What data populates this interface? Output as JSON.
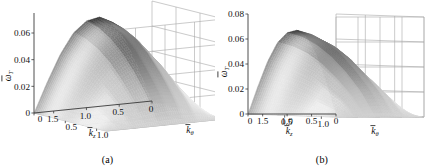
{
  "figure": {
    "panel_count": 2,
    "background_color": "#ffffff",
    "line_color": "#9a9a9a",
    "axis_color": "#4d4d4d",
    "surface_dark": "#1a1a1a",
    "surface_light": "#d8d8d8"
  },
  "chart_data": [
    {
      "type": "surface",
      "panel": "a",
      "caption": "(a)",
      "title": "",
      "view": "oblique-3d",
      "zlabel": "w_T",
      "zlabel_parts": {
        "base": "ω",
        "overbar": true,
        "subscript": "T"
      },
      "zticks": [
        0,
        0.02,
        0.04,
        0.06
      ],
      "ztick_labels": [
        "0",
        "0.02",
        "0.04",
        "0.06"
      ],
      "zlim": [
        0,
        0.07
      ],
      "xlabel": "k_z",
      "xlabel_parts": {
        "base": "k",
        "overbar": true,
        "subscript": "z"
      },
      "xticks": [
        1.5,
        1.0,
        0.5,
        0
      ],
      "xtick_labels": [
        "1.5",
        "1.0",
        "0.5",
        "0"
      ],
      "xlim": [
        1.8,
        0
      ],
      "ylabel": "k_theta",
      "ylabel_parts": {
        "base": "k",
        "overbar": true,
        "subscript": "θ"
      },
      "yticks": [
        0,
        0.5,
        1.0
      ],
      "ytick_labels": [
        "0",
        "0.5",
        "1.0"
      ],
      "ylim": [
        0,
        1.15
      ],
      "grid": true,
      "legend": "none",
      "peak_value": 0.067,
      "peak_at": {
        "k_z": 1.2,
        "k_theta": 0.0
      },
      "surface_z": [
        [
          0.0,
          0.0,
          0.0,
          0.0,
          0.0,
          0.0,
          0.0
        ],
        [
          0.022,
          0.021,
          0.019,
          0.016,
          0.012,
          0.007,
          0.0
        ],
        [
          0.042,
          0.04,
          0.036,
          0.03,
          0.022,
          0.013,
          0.0
        ],
        [
          0.057,
          0.054,
          0.049,
          0.041,
          0.03,
          0.017,
          0.0
        ],
        [
          0.065,
          0.062,
          0.056,
          0.047,
          0.035,
          0.02,
          0.0
        ],
        [
          0.067,
          0.064,
          0.058,
          0.049,
          0.036,
          0.021,
          0.0
        ],
        [
          0.062,
          0.059,
          0.054,
          0.045,
          0.033,
          0.019,
          0.0
        ],
        [
          0.048,
          0.046,
          0.042,
          0.035,
          0.026,
          0.015,
          0.0
        ],
        [
          0.026,
          0.025,
          0.022,
          0.019,
          0.014,
          0.008,
          0.0
        ],
        [
          0.0,
          0.0,
          0.0,
          0.0,
          0.0,
          0.0,
          0.0
        ]
      ]
    },
    {
      "type": "surface",
      "panel": "b",
      "caption": "(b)",
      "title": "",
      "view": "front-3d",
      "zlabel": "w_T",
      "zlabel_parts": {
        "base": "ω",
        "overbar": true,
        "subscript": "T"
      },
      "zticks": [
        0,
        0.02,
        0.04,
        0.06,
        0.08
      ],
      "ztick_labels": [
        "0",
        "0.02",
        "0.04",
        "0.06",
        "0.08"
      ],
      "zlim": [
        0,
        0.08
      ],
      "xlabel": "k_z",
      "xlabel_parts": {
        "base": "k",
        "overbar": true,
        "subscript": "z"
      },
      "xticks": [
        1.5,
        1.0,
        0.5,
        0
      ],
      "xtick_labels": [
        "1.5",
        "1.0",
        "0.5",
        "0"
      ],
      "xlim": [
        1.8,
        0
      ],
      "ylabel": "k_theta",
      "ylabel_parts": {
        "base": "k",
        "overbar": true,
        "subscript": "θ"
      },
      "yticks": [
        0,
        0.5,
        1.0
      ],
      "ytick_labels": [
        "0",
        "0.5",
        "1.0"
      ],
      "ylim": [
        0,
        1.2
      ],
      "grid": true,
      "legend": "none",
      "peak_value": 0.067,
      "peak_at": {
        "k_z": 1.2,
        "k_theta": 0.0
      },
      "surface_z": [
        [
          0.0,
          0.0,
          0.0,
          0.0,
          0.0,
          0.0,
          0.0
        ],
        [
          0.022,
          0.021,
          0.019,
          0.016,
          0.012,
          0.007,
          0.0
        ],
        [
          0.042,
          0.04,
          0.036,
          0.03,
          0.022,
          0.013,
          0.0
        ],
        [
          0.057,
          0.054,
          0.049,
          0.041,
          0.03,
          0.017,
          0.0
        ],
        [
          0.065,
          0.062,
          0.056,
          0.047,
          0.035,
          0.02,
          0.0
        ],
        [
          0.067,
          0.064,
          0.058,
          0.049,
          0.036,
          0.021,
          0.0
        ],
        [
          0.062,
          0.059,
          0.054,
          0.045,
          0.033,
          0.019,
          0.0
        ],
        [
          0.048,
          0.046,
          0.042,
          0.035,
          0.026,
          0.015,
          0.0
        ],
        [
          0.026,
          0.025,
          0.022,
          0.019,
          0.014,
          0.008,
          0.0
        ],
        [
          0.0,
          0.0,
          0.0,
          0.0,
          0.0,
          0.0,
          0.0
        ]
      ]
    }
  ],
  "panel_a": {
    "caption": "(a)",
    "zticks": [
      "0",
      "0.02",
      "0.04",
      "0.06"
    ],
    "xticks": [
      "1.5",
      "1.0",
      "0.5",
      "0"
    ],
    "yticks": [
      "0",
      "0.5",
      "1.0"
    ],
    "z_axis_base": "ω",
    "z_axis_sub": "T",
    "x_axis_base": "k",
    "x_axis_sub": "z",
    "y_axis_base": "k",
    "y_axis_sub": "θ"
  },
  "panel_b": {
    "caption": "(b)",
    "zticks": [
      "0",
      "0.02",
      "0.04",
      "0.06",
      "0.08"
    ],
    "xticks": [
      "1.5",
      "1.0",
      "0.5",
      "0"
    ],
    "yticks": [
      "0",
      "0.5",
      "1.0"
    ],
    "z_axis_base": "ω",
    "z_axis_sub": "T",
    "x_axis_base": "k",
    "x_axis_sub": "z",
    "y_axis_base": "k",
    "y_axis_sub": "θ"
  }
}
